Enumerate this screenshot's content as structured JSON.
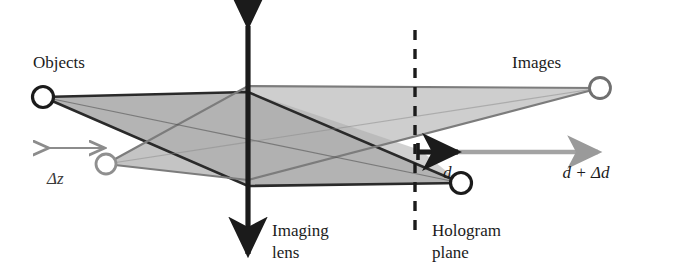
{
  "figure": {
    "kind": "optics-ray-diagram",
    "title_visible": false,
    "background_color": "#ffffff",
    "labels": {
      "objects": "Objects",
      "images": "Images",
      "imaging_lens_line1": "Imaging",
      "imaging_lens_line2": "lens",
      "hologram_plane_line1": "Hologram",
      "hologram_plane_line2": "plane",
      "delta_z": "Δz",
      "d": "d",
      "d_plus_delta_d": "d + Δd"
    },
    "colors": {
      "ink": "#1b1b1b",
      "gray_ink": "#8c8c8c",
      "gray_ink_dark": "#6f6f6f",
      "cone_fill_light": "#cfcfcf",
      "cone_fill_mid": "#b9b9b9",
      "cone_fill_dark": "#a9a9a9"
    },
    "points": [
      {
        "name": "object-near",
        "role": "object",
        "style": "black-outline-circle",
        "x": 43,
        "y": 97,
        "r": 11
      },
      {
        "name": "object-far",
        "role": "object",
        "style": "gray-outline-circle",
        "x": 106,
        "y": 164,
        "r": 10
      },
      {
        "name": "image-at-hologram",
        "role": "image",
        "style": "black-outline-circle",
        "x": 461,
        "y": 183,
        "r": 11
      },
      {
        "name": "image-shifted",
        "role": "image",
        "style": "gray-outline-circle",
        "x": 600,
        "y": 88,
        "r": 11
      }
    ],
    "lens": {
      "name": "imaging-lens-axis",
      "x": 248,
      "top_y": 18,
      "bottom_y": 262,
      "double_headed": true,
      "color": "#1b1b1b"
    },
    "hologram_plane": {
      "name": "hologram-plane-dashed-line",
      "x": 415,
      "top_y": 30,
      "bottom_y": 237,
      "dash": "9 8",
      "color": "#1b1b1b"
    },
    "measures": [
      {
        "name": "delta-z-measure",
        "label": "Δz",
        "orientation": "horizontal",
        "double_headed": true,
        "x_start": 43,
        "x_end": 106,
        "y": 148,
        "color": "#8c8c8c",
        "label_x": 62,
        "label_y": 183
      },
      {
        "name": "d-measure",
        "label": "d",
        "orientation": "horizontal",
        "double_headed": false,
        "x_start": 416,
        "x_end": 462,
        "y": 152,
        "color": "#1b1b1b",
        "label_x": 447,
        "label_y": 178
      },
      {
        "name": "d-plus-delta-d-measure",
        "label": "d + Δd",
        "orientation": "horizontal",
        "double_headed": false,
        "x_start": 416,
        "x_end": 601,
        "y": 152,
        "color": "#9a9a9a",
        "label_x": 586,
        "label_y": 178
      }
    ],
    "label_positions": {
      "objects": {
        "x": 33,
        "y": 68,
        "anchor": "start"
      },
      "images": {
        "x": 512,
        "y": 68,
        "anchor": "start"
      },
      "imaging_lens": {
        "x": 272,
        "y": 236,
        "anchor": "start",
        "line_height": 22
      },
      "hologram_plane": {
        "x": 432,
        "y": 236,
        "anchor": "start",
        "line_height": 22
      }
    },
    "ray_bundles": [
      {
        "name": "cone-object-near-to-image-hologram",
        "from": "object-near",
        "to": "image-at-hologram",
        "fill": "#bdbdbd",
        "describes": "rays from near object through lens aperture converging on hologram-plane image point"
      },
      {
        "name": "cone-object-far-to-image-shifted",
        "from": "object-far",
        "to": "image-shifted",
        "fill": "#cacaca",
        "describes": "rays from far object through lens aperture converging on shifted image point beyond hologram plane"
      }
    ],
    "marginal_rays": [
      {
        "name": "ray-near-upper",
        "from": "object-near",
        "via_lens_y": 92,
        "to": "image-at-hologram"
      },
      {
        "name": "ray-near-lower",
        "from": "object-near",
        "via_lens_y": 186,
        "to": "image-at-hologram"
      },
      {
        "name": "ray-far-upper",
        "from": "object-far",
        "via_lens_y": 86,
        "to": "image-shifted"
      },
      {
        "name": "ray-far-lower",
        "from": "object-far",
        "via_lens_y": 180,
        "to": "image-shifted"
      }
    ]
  }
}
